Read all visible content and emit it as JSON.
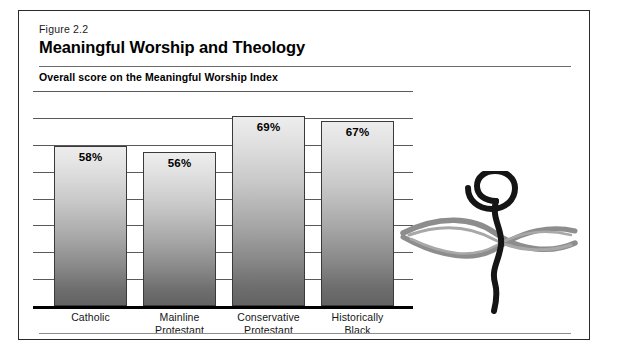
{
  "figure": {
    "number": "Figure 2.2",
    "title": "Meaningful Worship and Theology",
    "subtitle": "Overall score on the Meaningful Worship Index"
  },
  "ornament": {
    "name": "spiral-brush-ornament"
  },
  "chart_data": {
    "type": "bar",
    "title": "Meaningful Worship and Theology",
    "subtitle": "Overall score on the Meaningful Worship Index",
    "xlabel": "",
    "ylabel": "",
    "ylim": [
      0,
      78
    ],
    "grid": true,
    "gridline_count": 8,
    "legend": "none",
    "value_labels_inside_bars": true,
    "categories": [
      "Catholic",
      "Mainline Protestant",
      "Conservative Protestant",
      "Historically Black"
    ],
    "category_lines": [
      [
        "Catholic"
      ],
      [
        "Mainline",
        "Protestant"
      ],
      [
        "Conservative",
        "Protestant"
      ],
      [
        "Historically",
        "Black"
      ]
    ],
    "values": [
      58,
      56,
      69,
      67
    ],
    "value_labels": [
      "58%",
      "56%",
      "69%",
      "67%"
    ],
    "bar_fill": "vertical-gradient-light-to-dark-gray",
    "bar_fill_top": "#ededed",
    "bar_fill_bottom": "#636363",
    "bar_border": "#3a3a3a",
    "axis_color": "#000000",
    "gridline_color": "#5a5a5a"
  }
}
